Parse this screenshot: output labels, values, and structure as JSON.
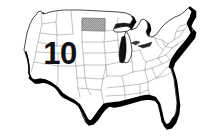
{
  "figure": {
    "kind": "choropleth-map",
    "region": "Contiguous United States",
    "background_color": "#ffffff"
  },
  "value_label": {
    "text": "10",
    "color": "#111111"
  },
  "highlight": {
    "state_name": "North Dakota",
    "fill_color": "#9a9a9a",
    "pattern": "halftone-dots"
  },
  "styles": {
    "state_border_color": "#8c8c8c",
    "outline_color": "#2b2b2b",
    "shadow_color": "#000000",
    "state_fill_color": "#ffffff",
    "lake_shadow_color": "#000000"
  },
  "icons": {
    "map_icon": "us-map-icon"
  }
}
